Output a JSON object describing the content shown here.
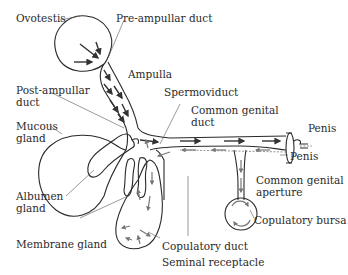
{
  "diagram": {
    "labels": {
      "ovotestis": "Ovotestis",
      "pre_ampullar_duct": "Pre-ampullar duct",
      "ampulla": "Ampulla",
      "post_ampullar_duct_1": "Post-ampullar",
      "post_ampullar_duct_2": "duct",
      "spermoviduct": "Spermoviduct",
      "common_genital_duct_1": "Common genital",
      "common_genital_duct_2": "duct",
      "mucous_gland_1": "Mucous",
      "mucous_gland_2": "gland",
      "penis_top": "Penis",
      "penis_bottom": "Penis",
      "common_genital_aperture_1": "Common genital",
      "common_genital_aperture_2": "aperture",
      "albumen_gland_1": "Albumen",
      "albumen_gland_2": "gland",
      "copulatory_bursa": "Copulatory bursa",
      "membrane_gland": "Membrane gland",
      "copulatory_duct": "Copulatory duct",
      "seminal_receptacle": "Seminal receptacle"
    },
    "colors": {
      "outline": "#2a2a2a",
      "arrow_dark": "#333333",
      "arrow_gray": "#777777",
      "background": "#ffffff"
    }
  }
}
